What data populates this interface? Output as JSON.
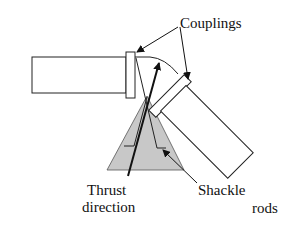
{
  "labels": {
    "couplings": "Couplings",
    "thrust_line1": "Thrust",
    "thrust_line2": "direction",
    "shackle": "Shackle",
    "rods": "rods"
  },
  "colors": {
    "stroke": "#111111",
    "triangle_fill": "#c8c8c8",
    "background": "#ffffff"
  }
}
